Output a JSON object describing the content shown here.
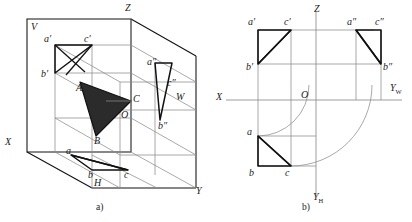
{
  "figure": {
    "colors": {
      "background": "#ffffff",
      "thick_line": "#111111",
      "thin_line": "#8c8c8c",
      "fill_triangle": "#2b2b2b",
      "text": "#1a1a1a"
    },
    "captions": [
      {
        "id": "cap-a",
        "text": "a)"
      },
      {
        "id": "cap-b",
        "text": "b)"
      }
    ]
  },
  "panel_a": {
    "caption": "a)",
    "description": "Axonometric view of the three projection planes V, H, W with triangle ABC and its three projections",
    "plane_labels": [
      {
        "name": "V",
        "text": "V"
      },
      {
        "name": "H",
        "text": "H"
      },
      {
        "name": "W",
        "text": "W"
      }
    ],
    "axis_labels": [
      {
        "name": "X",
        "text": "X"
      },
      {
        "name": "Y",
        "text": "Y"
      },
      {
        "name": "Z",
        "text": "Z"
      }
    ],
    "origin_label": "O",
    "space_points": [
      {
        "name": "A",
        "text": "A"
      },
      {
        "name": "B",
        "text": "B"
      },
      {
        "name": "C",
        "text": "C"
      }
    ],
    "frontal_projection": [
      {
        "name": "a-prime",
        "text": "a′"
      },
      {
        "name": "b-prime",
        "text": "b′"
      },
      {
        "name": "c-prime",
        "text": "c′"
      }
    ],
    "horizontal_projection": [
      {
        "name": "a",
        "text": "a"
      },
      {
        "name": "b",
        "text": "b"
      },
      {
        "name": "c",
        "text": "c"
      }
    ],
    "profile_projection": [
      {
        "name": "a-double-prime",
        "text": "a″"
      },
      {
        "name": "b-double-prime",
        "text": "b″"
      },
      {
        "name": "c-double-prime",
        "text": "c″"
      }
    ]
  },
  "panel_b": {
    "caption": "b)",
    "description": "Unfolded orthographic projection drawing with axes X, Z, Y_H, Y_W and quarter arcs linking Y_H to Y_W",
    "axis_labels": [
      {
        "name": "X",
        "text": "X",
        "sub": ""
      },
      {
        "name": "Z",
        "text": "Z",
        "sub": ""
      },
      {
        "name": "Y-W",
        "text": "Y",
        "sub": "W"
      },
      {
        "name": "Y-H",
        "text": "Y",
        "sub": "H"
      }
    ],
    "origin_label": "O",
    "frontal_projection": [
      {
        "name": "a-prime",
        "text": "a′"
      },
      {
        "name": "b-prime",
        "text": "b′"
      },
      {
        "name": "c-prime",
        "text": "c′"
      }
    ],
    "horizontal_projection": [
      {
        "name": "a",
        "text": "a"
      },
      {
        "name": "b",
        "text": "b"
      },
      {
        "name": "c",
        "text": "c"
      }
    ],
    "profile_projection": [
      {
        "name": "a-double-prime",
        "text": "a″"
      },
      {
        "name": "b-double-prime",
        "text": "b″"
      },
      {
        "name": "c-double-prime",
        "text": "c″"
      }
    ]
  }
}
